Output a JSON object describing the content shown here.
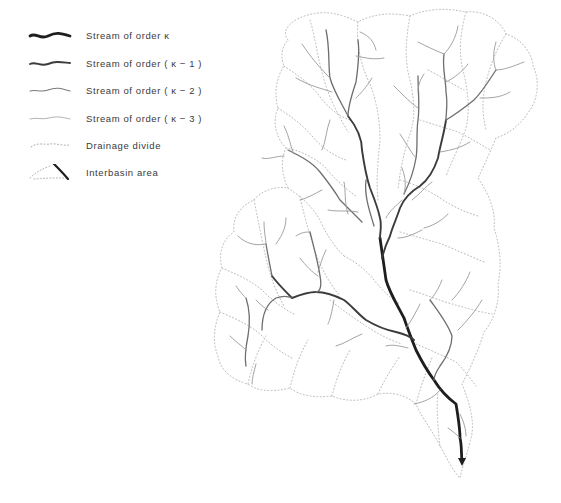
{
  "figure": {
    "type": "drainage-network-diagram",
    "legend": {
      "items": [
        {
          "label": "Stream of order κ",
          "symbol": "stream-order-k",
          "line_width": 2.8,
          "color": "#1e1e1e"
        },
        {
          "label": "Stream of order ( κ − 1 )",
          "symbol": "stream-order-k-minus-1",
          "line_width": 1.9,
          "color": "#3c3c3c"
        },
        {
          "label": "Stream of order ( κ − 2 )",
          "symbol": "stream-order-k-minus-2",
          "line_width": 1.3,
          "color": "#6e6e6e"
        },
        {
          "label": "Stream of order ( κ − 3 )",
          "symbol": "stream-order-k-minus-3",
          "line_width": 0.9,
          "color": "#9a9a9a"
        },
        {
          "label": "Drainage divide",
          "symbol": "dotted-line",
          "color": "#b9b9b9"
        },
        {
          "label": "Interbasin area",
          "symbol": "interbasin-wedge",
          "color": "#1e1e1e"
        }
      ]
    },
    "colors": {
      "background": "#ffffff",
      "divide": "#b9b9b9",
      "text": "#3a3a3a"
    }
  }
}
